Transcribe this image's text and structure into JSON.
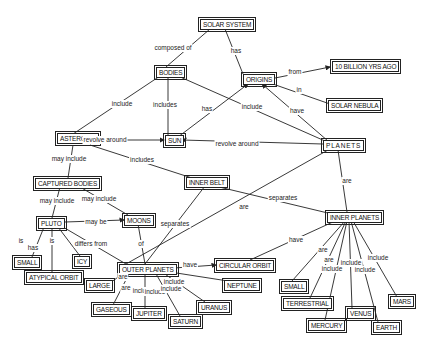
{
  "nodes": {
    "solar_system": {
      "label": "SOLAR SYSTEM",
      "x": 200,
      "y": 19
    },
    "bodies": {
      "label": "BODIES",
      "x": 156,
      "y": 67
    },
    "origins": {
      "label": "ORIGINS",
      "x": 243,
      "y": 74
    },
    "ten_billion": {
      "label": "10 BILLION YRS AGO",
      "x": 332,
      "y": 61
    },
    "solar_nebula": {
      "label": "SOLAR NEBULA",
      "x": 328,
      "y": 103
    },
    "asteroids": {
      "label": "ASTEROIDS",
      "x": 57,
      "y": 136
    },
    "sun": {
      "label": "SUN",
      "x": 165,
      "y": 136
    },
    "planets": {
      "label": "PLANETS",
      "x": 323,
      "y": 140
    },
    "captured_bodies": {
      "label": "CAPTURED BODIES",
      "x": 35,
      "y": 178
    },
    "inner_belt": {
      "label": "INNER BELT",
      "x": 191,
      "y": 177
    },
    "pluto": {
      "label": "PLUTO",
      "x": 38,
      "y": 218
    },
    "moons": {
      "label": "MOONS",
      "x": 124,
      "y": 215
    },
    "inner_planets": {
      "label": "INNER PLANETS",
      "x": 327,
      "y": 212
    },
    "small_pluto": {
      "label": "SMALL",
      "x": 18,
      "y": 257
    },
    "icy": {
      "label": "ICY",
      "x": 74,
      "y": 256
    },
    "atypical_orbit": {
      "label": "ATYPICAL ORBIT",
      "x": 26,
      "y": 272
    },
    "outer_planets": {
      "label": "OUTER PLANETS",
      "x": 119,
      "y": 264
    },
    "circular_orbit": {
      "label": "CIRCULAR ORBIT",
      "x": 216,
      "y": 260
    },
    "large": {
      "label": "LARGE",
      "x": 86,
      "y": 280
    },
    "neptune": {
      "label": "NEPTUNE",
      "x": 224,
      "y": 280
    },
    "gaseous": {
      "label": "GASEOUS",
      "x": 93,
      "y": 305
    },
    "jupiter": {
      "label": "JUPITER",
      "x": 133,
      "y": 308
    },
    "uranus": {
      "label": "URANUS",
      "x": 198,
      "y": 302
    },
    "saturn": {
      "label": "SATURN",
      "x": 170,
      "y": 316
    },
    "small_inner": {
      "label": "SMALL",
      "x": 281,
      "y": 281
    },
    "terrestrial": {
      "label": "TERRESTRIAL",
      "x": 283,
      "y": 298
    },
    "mercury": {
      "label": "MERCURY",
      "x": 308,
      "y": 320
    },
    "venus": {
      "label": "VENUS",
      "x": 347,
      "y": 308
    },
    "earth": {
      "label": "EARTH",
      "x": 373,
      "y": 322
    },
    "mars": {
      "label": "MARS",
      "x": 391,
      "y": 297
    }
  },
  "links": [
    {
      "text": "composed of",
      "x": 173,
      "y": 48
    },
    {
      "text": "has",
      "x": 236,
      "y": 51
    },
    {
      "text": "from",
      "x": 295,
      "y": 72
    },
    {
      "text": "in",
      "x": 299,
      "y": 90
    },
    {
      "text": "include",
      "x": 122,
      "y": 104
    },
    {
      "text": "includes",
      "x": 165,
      "y": 105
    },
    {
      "text": "has",
      "x": 207,
      "y": 109
    },
    {
      "text": "include",
      "x": 252,
      "y": 107
    },
    {
      "text": "have",
      "x": 297,
      "y": 111
    },
    {
      "text": "revolve  around",
      "x": 105,
      "y": 140
    },
    {
      "text": "revolve  around",
      "x": 237,
      "y": 144
    },
    {
      "text": "may include",
      "x": 69,
      "y": 159
    },
    {
      "text": "includes",
      "x": 142,
      "y": 160
    },
    {
      "text": "are",
      "x": 347,
      "y": 181
    },
    {
      "text": "may include",
      "x": 57,
      "y": 201
    },
    {
      "text": "may include",
      "x": 99,
      "y": 199
    },
    {
      "text": "may be",
      "x": 96,
      "y": 222
    },
    {
      "text": "separates",
      "x": 283,
      "y": 198
    },
    {
      "text": "are",
      "x": 244,
      "y": 207
    },
    {
      "text": "separates",
      "x": 175,
      "y": 224
    },
    {
      "text": "is",
      "x": 21,
      "y": 241
    },
    {
      "text": "has",
      "x": 33,
      "y": 248
    },
    {
      "text": "is",
      "x": 52,
      "y": 241
    },
    {
      "text": "differs  from",
      "x": 91,
      "y": 244
    },
    {
      "text": "of",
      "x": 141,
      "y": 244
    },
    {
      "text": "have",
      "x": 296,
      "y": 240
    },
    {
      "text": "have",
      "x": 190,
      "y": 265
    },
    {
      "text": "are",
      "x": 123,
      "y": 277
    },
    {
      "text": "are",
      "x": 126,
      "y": 288
    },
    {
      "text": "include",
      "x": 143,
      "y": 291
    },
    {
      "text": "include",
      "x": 155,
      "y": 292
    },
    {
      "text": "include",
      "x": 174,
      "y": 282
    },
    {
      "text": "include",
      "x": 171,
      "y": 289
    },
    {
      "text": "are",
      "x": 323,
      "y": 250
    },
    {
      "text": "are",
      "x": 329,
      "y": 260
    },
    {
      "text": "include",
      "x": 332,
      "y": 269
    },
    {
      "text": "include",
      "x": 351,
      "y": 263
    },
    {
      "text": "include",
      "x": 365,
      "y": 270
    },
    {
      "text": "include",
      "x": 378,
      "y": 258
    }
  ]
}
